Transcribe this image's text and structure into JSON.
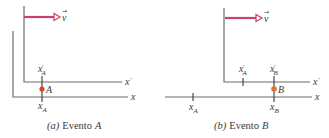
{
  "colors": {
    "axis": "#6b6b6b",
    "velocity_arrow": "#c8406e",
    "event_a_dot": "#e0402e",
    "event_b_dot": "#e2703a",
    "text": "#3a3a3a"
  },
  "panels": [
    {
      "id": "a",
      "caption_letter": "(a)",
      "caption_word": "Evento",
      "caption_event": "A",
      "axis_x_label": "x",
      "axis_xprime_label": "x",
      "prime": "′",
      "velocity_label": "v",
      "velocity_arrow_glyph": "→",
      "event_label": "A",
      "ticks": [
        {
          "frame": "S'",
          "label": "x",
          "sub": "A",
          "primed": true
        },
        {
          "frame": "S",
          "label": "x",
          "sub": "A",
          "primed": false
        }
      ]
    },
    {
      "id": "b",
      "caption_letter": "(b)",
      "caption_word": "Evento",
      "caption_event": "B",
      "axis_x_label": "x",
      "axis_xprime_label": "x",
      "prime": "′",
      "velocity_label": "v",
      "velocity_arrow_glyph": "→",
      "event_label": "B",
      "ticks": [
        {
          "frame": "S",
          "label": "x",
          "sub": "A",
          "primed": false
        },
        {
          "frame": "S'",
          "label": "x",
          "sub": "A",
          "primed": true
        },
        {
          "frame": "S'",
          "label": "x",
          "sub": "B",
          "primed": true
        },
        {
          "frame": "S",
          "label": "x",
          "sub": "B",
          "primed": false
        }
      ]
    }
  ]
}
